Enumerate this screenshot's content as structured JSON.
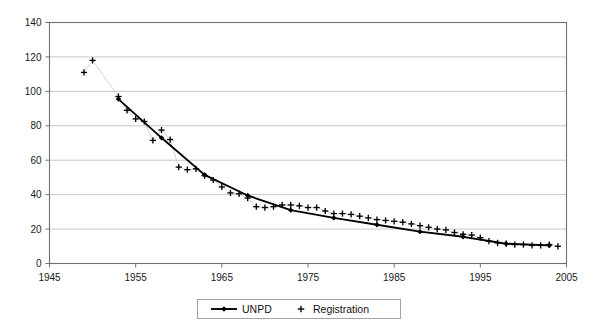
{
  "chart_data": {
    "type": "line",
    "title": "",
    "subtitle": "",
    "xlabel": "",
    "ylabel": "",
    "xlim": [
      1945,
      2005
    ],
    "ylim": [
      0,
      140
    ],
    "grid": true,
    "grid_axis": "y",
    "legend_position": "bottom-center",
    "x_ticks": [
      1945,
      1955,
      1965,
      1975,
      1985,
      1995,
      2005
    ],
    "x_tick_labels": [
      "1945",
      "1955",
      "1965",
      "1975",
      "1985",
      "1995",
      "2005"
    ],
    "y_ticks": [
      0,
      20,
      40,
      60,
      80,
      100,
      120,
      140
    ],
    "y_tick_labels": [
      "0",
      "20",
      "40",
      "60",
      "80",
      "100",
      "120",
      "140"
    ],
    "series": [
      {
        "name": "UNPD",
        "marker": "diamond",
        "line_color": "#000000",
        "marker_color": "#000000",
        "x": [
          1953,
          1958,
          1963,
          1968,
          1973,
          1978,
          1983,
          1988,
          1993,
          1998,
          2003
        ],
        "values": [
          95.5,
          73,
          51.5,
          39.5,
          31,
          26.5,
          22.5,
          18.5,
          15.5,
          11.5,
          10.5
        ]
      },
      {
        "name": "Registration",
        "marker": "plus",
        "line_color": "#c2c2c2",
        "marker_color": "#000000",
        "x": [
          1949,
          1950,
          1953,
          1954,
          1955,
          1956,
          1957,
          1958,
          1959,
          1960,
          1961,
          1962,
          1963,
          1964,
          1965,
          1966,
          1967,
          1968,
          1969,
          1970,
          1971,
          1972,
          1973,
          1974,
          1975,
          1976,
          1977,
          1978,
          1979,
          1980,
          1981,
          1982,
          1983,
          1984,
          1985,
          1986,
          1987,
          1988,
          1989,
          1990,
          1991,
          1992,
          1993,
          1994,
          1995,
          1996,
          1997,
          1998,
          1999,
          2000,
          2001,
          2002,
          2003,
          2004
        ],
        "values": [
          111,
          118,
          97,
          89,
          84,
          82.5,
          71.5,
          77.5,
          72,
          56,
          54.5,
          55,
          51,
          48.5,
          44.5,
          41,
          40.5,
          38,
          33,
          32.5,
          33,
          34,
          34,
          33.5,
          32.5,
          32.5,
          30.5,
          29,
          29,
          28.5,
          27.5,
          26.5,
          25.5,
          25,
          24.5,
          24,
          23,
          22,
          21,
          20,
          19.5,
          18,
          17,
          16.5,
          15,
          13,
          12,
          11.5,
          11,
          11,
          10.5,
          10.5,
          11,
          10
        ]
      }
    ]
  },
  "axes": {
    "y_axis_name": "y-axis",
    "x_axis_name": "x-axis"
  },
  "legend": {
    "entries": [
      {
        "label": "UNPD",
        "marker": "diamond-line"
      },
      {
        "label": "Registration",
        "marker": "plus"
      }
    ]
  }
}
